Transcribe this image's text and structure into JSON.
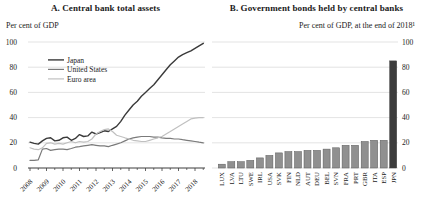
{
  "figure": {
    "panel_a": {
      "title": "A. Central bank total assets",
      "subtitle": "Per cent of GDP"
    },
    "panel_b": {
      "title": "B. Government bonds held by central banks",
      "subtitle": "Per cent of GDP, at the end of 2018¹"
    }
  },
  "colors": {
    "japan": "#3a3a3a",
    "united_states": "#7a7a7a",
    "euro_area": "#c0c0c0",
    "bar": "#909090",
    "bar_stroke": "#5a5a5a",
    "bar_highlight": "#3c3c3c",
    "grid": "#dcdcdc",
    "axis": "#3c3c3c",
    "text": "#1a1a1a"
  },
  "chart_data": [
    {
      "type": "line",
      "title": "A. Central bank total assets",
      "subtitle": "Per cent of GDP",
      "ylim": [
        0,
        100
      ],
      "yticks": [
        0,
        20,
        40,
        60,
        80,
        100
      ],
      "xticks": [
        2008,
        2009,
        2010,
        2011,
        2012,
        2013,
        2014,
        2015,
        2016,
        2017,
        2018
      ],
      "grid": true,
      "legend_position": "upper-left",
      "x": [
        2008,
        2008.25,
        2008.5,
        2008.75,
        2009,
        2009.25,
        2009.5,
        2009.75,
        2010,
        2010.25,
        2010.5,
        2010.75,
        2011,
        2011.25,
        2011.5,
        2011.75,
        2012,
        2012.25,
        2012.5,
        2012.75,
        2013,
        2013.25,
        2013.5,
        2013.75,
        2014,
        2014.25,
        2014.5,
        2014.75,
        2015,
        2015.25,
        2015.5,
        2015.75,
        2016,
        2016.25,
        2016.5,
        2016.75,
        2017,
        2017.25,
        2017.5,
        2017.75,
        2018,
        2018.25,
        2018.5
      ],
      "series": [
        {
          "name": "Japan",
          "color_key": "japan",
          "values": [
            20.5,
            19.5,
            19,
            21.5,
            23.5,
            24,
            21.5,
            22,
            24,
            24.5,
            22,
            23.5,
            26.5,
            25,
            25.5,
            28.5,
            27,
            28,
            29.5,
            29,
            31,
            33,
            37,
            42,
            46,
            50,
            53,
            57,
            60,
            63,
            66,
            70,
            74,
            78,
            82,
            85,
            88,
            90,
            91.5,
            93,
            95,
            97,
            99
          ]
        },
        {
          "name": "United States",
          "color_key": "united_states",
          "values": [
            6,
            6,
            6.5,
            15,
            15.5,
            14,
            14.5,
            15,
            15,
            14.5,
            15.5,
            16.5,
            17,
            17.5,
            18,
            18.5,
            18,
            17.5,
            17.5,
            17,
            18,
            19,
            20,
            21.5,
            23,
            24,
            24.5,
            25,
            25,
            25,
            24.5,
            24.5,
            24,
            23.5,
            23.5,
            23,
            23,
            22.5,
            22,
            21.5,
            21,
            20.5,
            20
          ]
        },
        {
          "name": "Euro area",
          "color_key": "euro_area",
          "values": [
            16,
            15,
            14.5,
            16,
            19.5,
            20,
            19,
            19.5,
            19,
            20,
            21,
            20,
            21,
            20.5,
            21,
            23,
            27,
            29,
            30.5,
            31,
            29,
            26,
            25,
            24,
            23,
            22,
            21.5,
            21,
            21,
            22,
            23,
            24,
            25,
            27,
            29,
            31,
            33,
            35,
            37,
            39,
            39.5,
            40,
            40
          ]
        }
      ]
    },
    {
      "type": "bar",
      "title": "B. Government bonds held by central banks",
      "subtitle": "Per cent of GDP, at the end of 2018¹",
      "categories": [
        "LUX",
        "LVA",
        "LTU",
        "SWE",
        "IRL",
        "USA",
        "SVK",
        "FIN",
        "NLD",
        "AUT",
        "DEU",
        "BEL",
        "SVN",
        "FRA",
        "PRT",
        "GBR",
        "ITA",
        "ESP",
        "JPN"
      ],
      "values": [
        3,
        5,
        5,
        6,
        8,
        10,
        12,
        13,
        13,
        14,
        14,
        15,
        16,
        18,
        18,
        21,
        22,
        22,
        85
      ],
      "ylim": [
        0,
        100
      ],
      "yticks": [
        0,
        20,
        40,
        60,
        80,
        100
      ],
      "yaxis_side": "right",
      "grid": true,
      "highlight_category": "JPN"
    }
  ]
}
